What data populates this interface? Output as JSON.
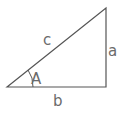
{
  "diagram": {
    "type": "right-triangle",
    "labels": {
      "hypotenuse": "c",
      "opposite": "a",
      "adjacent": "b",
      "angle": "A"
    },
    "colors": {
      "line": "#555555",
      "label": "#6b6b6b",
      "background": "#ffffff"
    }
  }
}
